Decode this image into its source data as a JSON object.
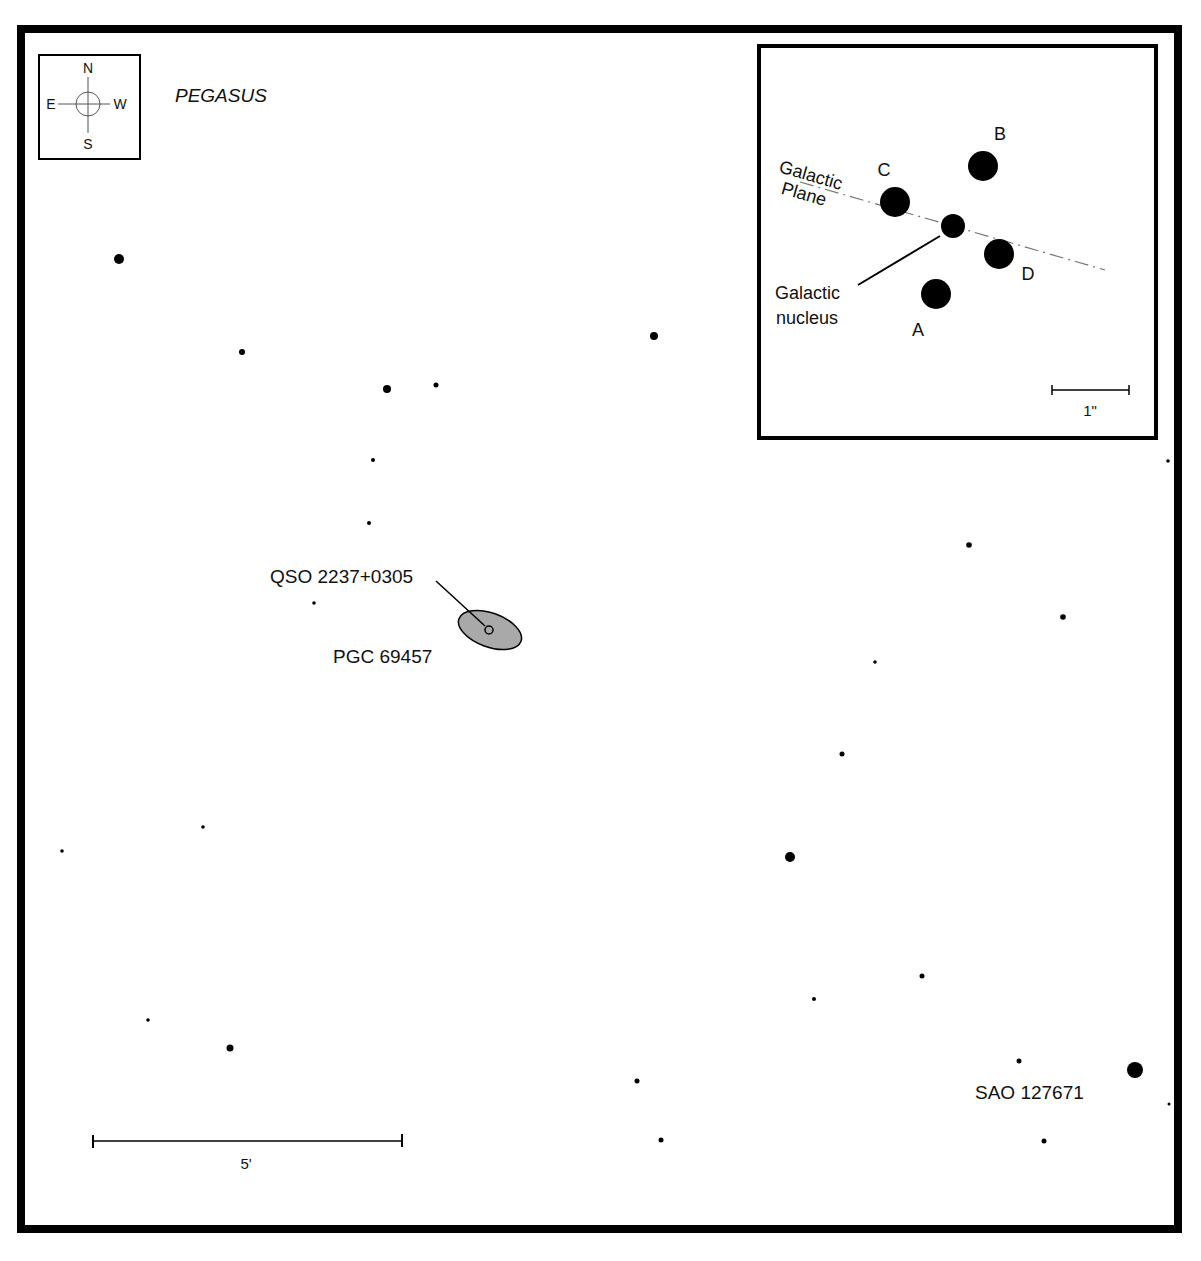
{
  "chart": {
    "constellation": "PEGASUS",
    "colors": {
      "ink": "#000000",
      "galaxy_fill": "#a9a9a9",
      "plane_line": "#777777",
      "background": "#ffffff"
    },
    "compass": {
      "north": "N",
      "south": "S",
      "east": "E",
      "west": "W"
    },
    "main_scale": {
      "label": "5'",
      "x1": 93,
      "x2": 402,
      "y": 1141
    },
    "targets": {
      "qso": {
        "label": "QSO 2237+0305",
        "x": 489,
        "y": 630
      },
      "galaxy": {
        "label": "PGC 69457",
        "cx": 490,
        "cy": 630,
        "rx": 33,
        "ry": 17,
        "angle": 20
      },
      "bright_star": {
        "label": "SAO 127671",
        "x": 1135,
        "y": 1070
      }
    },
    "stars": [
      {
        "x": 119,
        "y": 259,
        "r": 5
      },
      {
        "x": 242,
        "y": 352,
        "r": 3
      },
      {
        "x": 387,
        "y": 389,
        "r": 4
      },
      {
        "x": 436,
        "y": 385,
        "r": 2.5
      },
      {
        "x": 373,
        "y": 460,
        "r": 2
      },
      {
        "x": 369,
        "y": 523,
        "r": 2
      },
      {
        "x": 314,
        "y": 603,
        "r": 1.8
      },
      {
        "x": 654,
        "y": 336,
        "r": 4
      },
      {
        "x": 1168,
        "y": 461,
        "r": 1.8
      },
      {
        "x": 969,
        "y": 545,
        "r": 2.8
      },
      {
        "x": 1063,
        "y": 617,
        "r": 2.8
      },
      {
        "x": 875,
        "y": 662,
        "r": 1.8
      },
      {
        "x": 842,
        "y": 754,
        "r": 2.5
      },
      {
        "x": 790,
        "y": 857,
        "r": 5
      },
      {
        "x": 203,
        "y": 827,
        "r": 1.8
      },
      {
        "x": 62,
        "y": 851,
        "r": 1.8
      },
      {
        "x": 922,
        "y": 976,
        "r": 2.5
      },
      {
        "x": 814,
        "y": 999,
        "r": 2
      },
      {
        "x": 148,
        "y": 1020,
        "r": 1.8
      },
      {
        "x": 230,
        "y": 1048,
        "r": 3.5
      },
      {
        "x": 637,
        "y": 1081,
        "r": 2.5
      },
      {
        "x": 1019,
        "y": 1061,
        "r": 2.5
      },
      {
        "x": 1135,
        "y": 1070,
        "r": 8
      },
      {
        "x": 1169,
        "y": 1104,
        "r": 1.5
      },
      {
        "x": 661,
        "y": 1140,
        "r": 2.5
      },
      {
        "x": 1044,
        "y": 1141,
        "r": 2.5
      }
    ],
    "inset": {
      "plane_label_line1": "Galactic",
      "plane_label_line2": "Plane",
      "nucleus_label_line1": "Galactic",
      "nucleus_label_line2": "nucleus",
      "scale_label": "1\"",
      "images": [
        {
          "id": "A",
          "label": "A",
          "x": 936,
          "y": 294,
          "r": 15,
          "lx": 918,
          "ly": 336
        },
        {
          "id": "B",
          "label": "B",
          "x": 983,
          "y": 166,
          "r": 15,
          "lx": 1000,
          "ly": 140
        },
        {
          "id": "C",
          "label": "C",
          "x": 895,
          "y": 202,
          "r": 15,
          "lx": 884,
          "ly": 176
        },
        {
          "id": "D",
          "label": "D",
          "x": 999,
          "y": 254,
          "r": 15,
          "lx": 1028,
          "ly": 280
        }
      ],
      "nucleus": {
        "x": 953,
        "y": 226,
        "r": 12
      }
    }
  }
}
